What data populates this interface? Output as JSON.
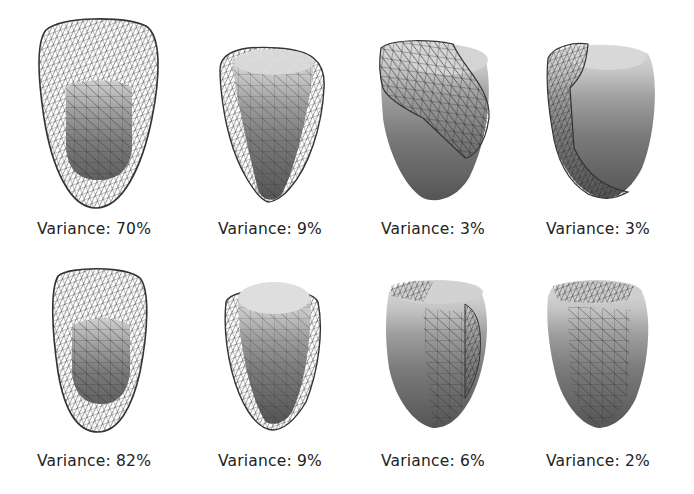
{
  "figure": {
    "rows": [
      {
        "panels": [
          {
            "label": "Variance: 70%",
            "variance": 70,
            "view": "wire-outer-inner-solid"
          },
          {
            "label": "Variance: 9%",
            "variance": 9,
            "view": "solid-with-side-wire"
          },
          {
            "label": "Variance: 3%",
            "variance": 3,
            "view": "solid-with-top-wire"
          },
          {
            "label": "Variance: 3%",
            "variance": 3,
            "view": "solid-with-left-wire"
          }
        ]
      },
      {
        "panels": [
          {
            "label": "Variance: 82%",
            "variance": 82,
            "view": "wire-outer-inner-solid"
          },
          {
            "label": "Variance: 9%",
            "variance": 9,
            "view": "solid-with-side-wire"
          },
          {
            "label": "Variance: 6%",
            "variance": 6,
            "view": "solid-with-right-wire"
          },
          {
            "label": "Variance: 2%",
            "variance": 2,
            "view": "solid-with-front-wire"
          }
        ]
      }
    ]
  },
  "colors": {
    "background": "#ffffff",
    "text": "#222222",
    "wire": "#333333",
    "solid_top": "#d6d6d6",
    "solid_mid": "#8a8a8a",
    "solid_bottom": "#5a5a5a"
  }
}
